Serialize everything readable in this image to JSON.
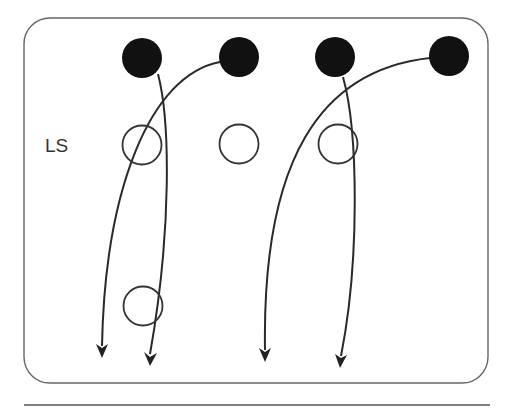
{
  "diagram": {
    "type": "play-diagram",
    "labels": [
      {
        "id": "ls",
        "text": "LS",
        "x": 45,
        "y": 135
      }
    ],
    "colors": {
      "stroke": "#2a2a2a",
      "frame": "#666666",
      "filled": "#111111",
      "background": "#ffffff"
    },
    "filled_players": [
      {
        "id": "o1",
        "cx": 142,
        "cy": 58
      },
      {
        "id": "o2",
        "cx": 239,
        "cy": 57
      },
      {
        "id": "o3",
        "cx": 335,
        "cy": 57
      },
      {
        "id": "o4",
        "cx": 449,
        "cy": 56
      }
    ],
    "open_players": [
      {
        "id": "d1",
        "cx": 142,
        "cy": 145
      },
      {
        "id": "d2",
        "cx": 239,
        "cy": 144
      },
      {
        "id": "d3",
        "cx": 338,
        "cy": 144
      },
      {
        "id": "d4",
        "cx": 143,
        "cy": 306
      }
    ],
    "routes": [
      {
        "from": "o1",
        "to_x": 150,
        "to_y": 364
      },
      {
        "from": "o2",
        "to_x": 102,
        "to_y": 356
      },
      {
        "from": "o3",
        "to_x": 341,
        "to_y": 366
      },
      {
        "from": "o4",
        "to_x": 265,
        "to_y": 360
      }
    ]
  }
}
